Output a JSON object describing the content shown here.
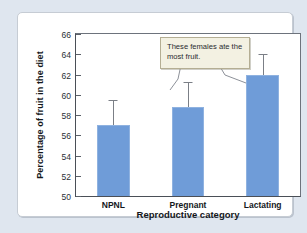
{
  "chart_data": {
    "type": "bar",
    "title": "",
    "subtitle": "",
    "xlabel": "Reproductive category",
    "ylabel": "Percentage of fruit in the diet",
    "categories": [
      "NPNL",
      "Pregnant",
      "Lactating"
    ],
    "values": [
      57.0,
      58.8,
      62.0
    ],
    "error_upper": [
      59.5,
      61.3,
      64.0
    ],
    "error_bars": "upper only",
    "ylim": [
      50,
      66
    ],
    "yticks": [
      50,
      52,
      54,
      56,
      58,
      60,
      62,
      64,
      66
    ],
    "ytick_labels": [
      "50",
      "52",
      "54",
      "56",
      "58",
      "60",
      "62",
      "64",
      "66"
    ],
    "grid": false,
    "legend": "none",
    "bar_color": "#6f9cd8",
    "annotations": [
      {
        "text": "These females ate the most fruit.",
        "points_to": [
          "Pregnant",
          "Lactating"
        ]
      }
    ]
  },
  "annotation": {
    "text": "These females ate the most fruit."
  },
  "axes": {
    "y_title": "Percentage of fruit in the diet",
    "x_title": "Reproductive category"
  },
  "colors": {
    "bar": "#6f9cd8",
    "bar_edge": "#8fb2e0",
    "frame": "#4a4f57",
    "callout_bg": "#f3f1e2",
    "callout_border": "#b4ae93",
    "page_bg": "#dfe6ef",
    "card_bg": "#ffffff"
  }
}
